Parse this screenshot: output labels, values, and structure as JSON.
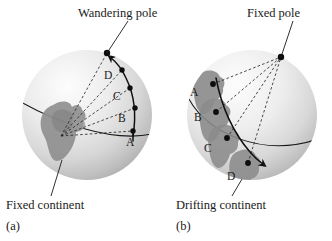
{
  "figure": {
    "type": "apparent-polar-wander-diagram",
    "background_color": "#ffffff",
    "ink_color": "#1a1a1a",
    "continent_color": "#8a8a8a",
    "sphere_light": "#f2f2f2",
    "sphere_shadow": "#b9b9b9"
  },
  "panel_a": {
    "caption_letter": "(a)",
    "pole_label": "Wandering pole",
    "continent_label": "Fixed continent",
    "sphere": {
      "cx": 87,
      "cy": 115,
      "r": 65
    },
    "pole_marker": {
      "x": 107,
      "y": 53
    },
    "convergence_point": {
      "x": 61,
      "y": 136
    },
    "path_points": [
      {
        "label": "A",
        "dot_x": 133,
        "dot_y": 131,
        "label_x": 126,
        "label_y": 146
      },
      {
        "label": "B",
        "dot_x": 135,
        "dot_y": 108,
        "label_x": 118,
        "label_y": 122
      },
      {
        "label": "C",
        "dot_x": 130,
        "dot_y": 88,
        "label_x": 113,
        "label_y": 100
      },
      {
        "label": "D",
        "dot_x": 122,
        "dot_y": 70,
        "label_x": 104,
        "label_y": 79
      }
    ],
    "path_direction": "arrow points toward wandering pole"
  },
  "panel_b": {
    "caption_letter": "(b)",
    "pole_label": "Fixed pole",
    "continent_label": "Drifting continent",
    "sphere": {
      "cx": 252,
      "cy": 115,
      "r": 65
    },
    "pole_marker": {
      "x": 281,
      "y": 57
    },
    "path_points": [
      {
        "label": "A",
        "dot_x": 213,
        "dot_y": 84,
        "label_x": 190,
        "label_y": 96
      },
      {
        "label": "B",
        "dot_x": 216,
        "dot_y": 112,
        "label_x": 194,
        "label_y": 121
      },
      {
        "label": "C",
        "dot_x": 227,
        "dot_y": 138,
        "label_x": 204,
        "label_y": 152
      },
      {
        "label": "D",
        "dot_x": 248,
        "dot_y": 163,
        "label_x": 227,
        "label_y": 180
      }
    ],
    "path_direction": "arrow points down-right along drift track"
  }
}
